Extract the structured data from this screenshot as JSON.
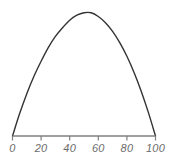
{
  "chart_data": {
    "type": "line",
    "title": "",
    "subtitle": "",
    "xlabel": "",
    "ylabel": "",
    "xlim": [
      0,
      100
    ],
    "ylim": [
      0,
      100
    ],
    "grid": false,
    "legend": null,
    "axis_color": "#808080",
    "curve_color": "#333333",
    "label_color": "#6b6b6b",
    "background_color": "#ffffff",
    "xticks": [
      0,
      20,
      40,
      60,
      80,
      100
    ],
    "xtick_labels": [
      "0",
      "20",
      "40",
      "60",
      "80",
      "100"
    ],
    "yticks": [],
    "ytick_labels": [],
    "series": [
      {
        "name": "curve",
        "x": [
          0,
          5,
          10,
          15,
          20,
          25,
          30,
          35,
          40,
          45,
          50,
          55,
          60,
          65,
          70,
          75,
          80,
          85,
          90,
          95,
          100
        ],
        "y": [
          0,
          18,
          34,
          48,
          60,
          71,
          80,
          87,
          93,
          97,
          99,
          99,
          96,
          91,
          84,
          75,
          64,
          51,
          36,
          19,
          0
        ]
      }
    ],
    "annotations": []
  },
  "axis": {
    "x_axis_name": "x-axis-line",
    "tick_count": 6
  }
}
